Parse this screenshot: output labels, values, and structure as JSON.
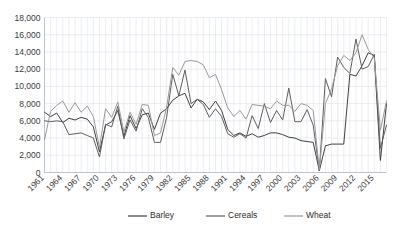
{
  "chart_data": {
    "type": "line",
    "title": "",
    "subtitle": "",
    "xlabel": "",
    "ylabel": "",
    "ylim": [
      0,
      18000
    ],
    "ytick_labels": [
      "18,000",
      "16,000",
      "14,000",
      "12,000",
      "10,000",
      "8,000",
      "6,000",
      "4,000",
      "2,000",
      "0"
    ],
    "ytick_values": [
      18000,
      16000,
      14000,
      12000,
      10000,
      8000,
      6000,
      4000,
      2000,
      0
    ],
    "grid": true,
    "grid_vertical": true,
    "legend_position": "bottom",
    "xtick_labels": [
      "1961",
      "1964",
      "1967",
      "1970",
      "1973",
      "1976",
      "1979",
      "1982",
      "1985",
      "1988",
      "1991",
      "1994",
      "1997",
      "2000",
      "2003",
      "2006",
      "2009",
      "2012",
      "2015"
    ],
    "x": [
      1961,
      1962,
      1963,
      1964,
      1965,
      1966,
      1967,
      1968,
      1969,
      1970,
      1971,
      1972,
      1973,
      1974,
      1975,
      1976,
      1977,
      1978,
      1979,
      1980,
      1981,
      1982,
      1983,
      1984,
      1985,
      1986,
      1987,
      1988,
      1989,
      1990,
      1991,
      1992,
      1993,
      1994,
      1995,
      1996,
      1997,
      1998,
      1999,
      2000,
      2001,
      2002,
      2003,
      2004,
      2005,
      2006,
      2007,
      2008,
      2009,
      2010,
      2011,
      2012,
      2013,
      2014,
      2015,
      2016,
      2017
    ],
    "series": [
      {
        "name": "Barley",
        "color": "#3f3f3f",
        "values": [
          7000,
          6500,
          6900,
          5800,
          6300,
          6100,
          6400,
          6200,
          5300,
          2400,
          5500,
          5900,
          7200,
          4200,
          6600,
          5100,
          6700,
          6900,
          5000,
          6900,
          7400,
          8400,
          8900,
          9200,
          7500,
          8500,
          8200,
          7300,
          8300,
          7200,
          5000,
          4300,
          4600,
          4200,
          4500,
          4100,
          4300,
          4600,
          4600,
          4400,
          4100,
          4000,
          3700,
          3600,
          3500,
          200,
          3100,
          3300,
          3300,
          3300,
          11400,
          11200,
          12400,
          13900,
          13600,
          1400,
          8000
        ]
      },
      {
        "name": "Cereals",
        "color": "#5f5f5f",
        "values": [
          6000,
          5900,
          6000,
          5900,
          4400,
          4500,
          4600,
          4300,
          4000,
          1800,
          5600,
          5300,
          7700,
          3900,
          6100,
          4800,
          7400,
          6400,
          3500,
          3500,
          6400,
          11400,
          8900,
          11900,
          8000,
          8500,
          7900,
          6400,
          7400,
          6500,
          4500,
          4100,
          4500,
          4000,
          6600,
          5100,
          8000,
          5800,
          7200,
          6100,
          9800,
          5900,
          5900,
          7300,
          5500,
          200,
          10900,
          8800,
          13400,
          12200,
          11500,
          15500,
          12000,
          12300,
          13700,
          2800,
          5500
        ]
      },
      {
        "name": "Wheat",
        "color": "#9a9a9a",
        "values": [
          3800,
          7100,
          7800,
          8300,
          7000,
          8100,
          7000,
          7700,
          6500,
          2900,
          7400,
          6400,
          8200,
          4700,
          7000,
          5600,
          7900,
          7800,
          4300,
          4600,
          7600,
          12200,
          11300,
          12900,
          13000,
          12900,
          12500,
          11000,
          11400,
          9600,
          7500,
          6500,
          7200,
          6200,
          7900,
          7800,
          7700,
          7400,
          8300,
          7800,
          7800,
          7100,
          8000,
          7800,
          7200,
          300,
          8000,
          9700,
          12400,
          13600,
          13000,
          13900,
          16000,
          14300,
          13300,
          4900,
          8300
        ]
      }
    ]
  },
  "legend": {
    "items": [
      {
        "label": "Barley",
        "color": "#3f3f3f"
      },
      {
        "label": "Cereals",
        "color": "#5f5f5f"
      },
      {
        "label": "Wheat",
        "color": "#9a9a9a"
      }
    ]
  }
}
